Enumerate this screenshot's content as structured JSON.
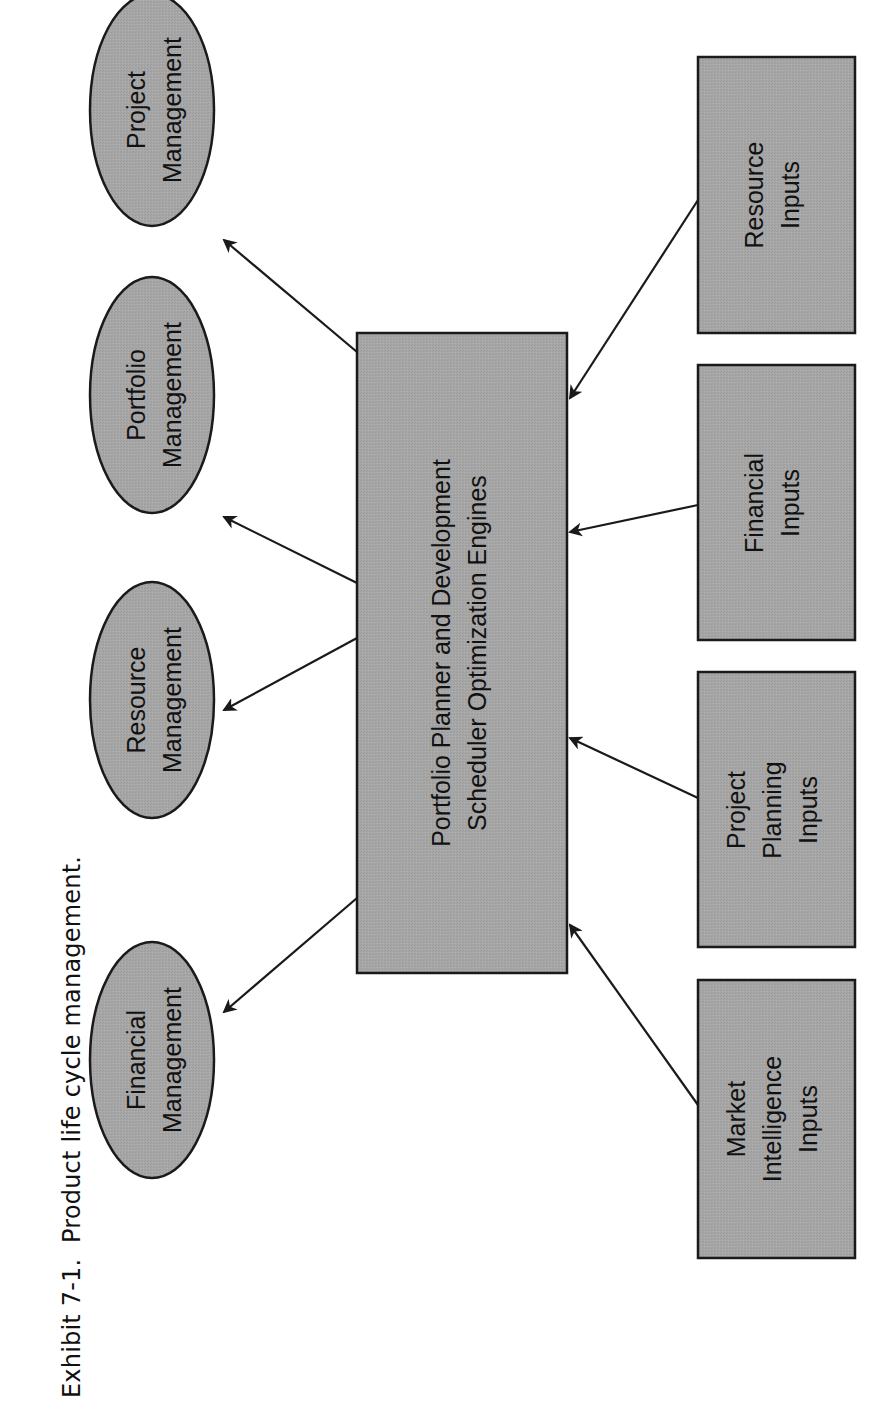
{
  "caption": {
    "label": "Exhibit 7-1.",
    "title": "Product life cycle management."
  },
  "source_fragment": "Source: IBM",
  "colors": {
    "node_fill": "#a3a3a3",
    "stroke": "#1a1a1a",
    "background": "#ffffff"
  },
  "diagram": {
    "orientation": "rotated-90-ccw",
    "center": {
      "line1": "Portfolio Planner and Development",
      "line2": "Scheduler Optimization Engines"
    },
    "outputs": [
      {
        "line1": "Financial",
        "line2": "Management"
      },
      {
        "line1": "Resource",
        "line2": "Management"
      },
      {
        "line1": "Portfolio",
        "line2": "Management"
      },
      {
        "line1": "Project",
        "line2": "Management"
      }
    ],
    "inputs": [
      {
        "line1": "Market",
        "line2": "Intelligence",
        "line3": "Inputs"
      },
      {
        "line1": "Project",
        "line2": "Planning",
        "line3": "Inputs"
      },
      {
        "line1": "Financial",
        "line2": "Inputs",
        "line3": ""
      },
      {
        "line1": "Resource",
        "line2": "Inputs",
        "line3": ""
      }
    ],
    "edges": [
      {
        "from": "center",
        "to": "Financial Management"
      },
      {
        "from": "center",
        "to": "Resource Management"
      },
      {
        "from": "center",
        "to": "Portfolio Management"
      },
      {
        "from": "center",
        "to": "Project Management"
      },
      {
        "from": "Market Intelligence Inputs",
        "to": "center"
      },
      {
        "from": "Project Planning Inputs",
        "to": "center"
      },
      {
        "from": "Financial Inputs",
        "to": "center"
      },
      {
        "from": "Resource Inputs",
        "to": "center"
      }
    ]
  }
}
